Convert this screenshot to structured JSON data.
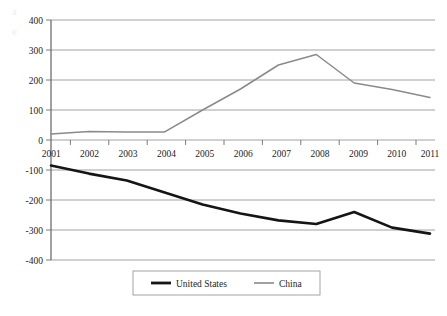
{
  "background_text": {
    "note": "faint show-through text from reverse page",
    "lines": [
      "a                                                                                 e",
      "                                                                                    ",
      "                                                                                    ",
      "                                                                                    ",
      "                                                                                    "
    ]
  },
  "chart_data": {
    "type": "line",
    "title": "",
    "subtitle": "",
    "xlabel": "",
    "ylabel": "",
    "x": [
      2001,
      2002,
      2003,
      2004,
      2005,
      2006,
      2007,
      2008,
      2009,
      2010,
      2011
    ],
    "categories": [
      "2001",
      "2002",
      "2003",
      "2004",
      "2005",
      "2006",
      "2007",
      "2008",
      "2009",
      "2010",
      "2011"
    ],
    "series": [
      {
        "name": "United States",
        "color": "#151515",
        "line_width": "thick",
        "values": [
          -85,
          -112,
          -135,
          -175,
          -215,
          -245,
          -268,
          -280,
          -240,
          -292,
          -312
        ]
      },
      {
        "name": "China",
        "color": "#8a8a8a",
        "line_width": "thin",
        "values": [
          20,
          28,
          27,
          27,
          100,
          170,
          250,
          285,
          190,
          168,
          142
        ]
      }
    ],
    "ylim": [
      -400,
      400
    ],
    "yticks": [
      400,
      300,
      200,
      100,
      0,
      -100,
      -200,
      -300,
      -400
    ],
    "ytick_labels": [
      "400",
      "300",
      "200",
      "100",
      "0",
      "-100",
      "-200",
      "-300",
      "-400"
    ],
    "xlim": [
      2001,
      2011
    ],
    "xtick_labels": [
      "2001",
      "2002",
      "2003",
      "2004",
      "2005",
      "2006",
      "2007",
      "2008",
      "2009",
      "2010",
      "2011"
    ],
    "grid": "horizontal",
    "legend_position": "bottom",
    "legend_entries": [
      "United States",
      "China"
    ],
    "axis_color": "#6e6e6e",
    "grid_color": "#8c8c8c",
    "plot_background": "#ffffff"
  }
}
